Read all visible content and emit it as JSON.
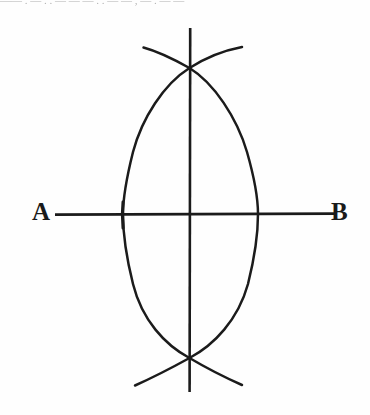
{
  "figure": {
    "background_color": "#fefefe",
    "ink_color": "#1b1b1b",
    "labels": {
      "left_endpoint": "A",
      "right_endpoint": "B"
    },
    "scan_artifact_text": "—— . — . . — — — . . — — , — . — —",
    "geometry": {
      "canvas": {
        "width": 370,
        "height": 415
      },
      "baseline": {
        "name": "segment-ab",
        "y": 214,
        "x_start": 55,
        "x_end": 335,
        "stroke_width": 2.6
      },
      "perpendicular": {
        "name": "vertical-bisector",
        "x": 190,
        "y_start": 28,
        "y_end": 392,
        "stroke_width": 2.6
      },
      "point_a": {
        "x": 123,
        "y": 214
      },
      "point_b": {
        "x": 264,
        "y": 214
      },
      "intersection_top": {
        "x": 190,
        "y": 68
      },
      "intersection_bottom": {
        "x": 190,
        "y": 358
      },
      "arc_radius": 156,
      "arc_left": {
        "name": "arc-centered-at-b",
        "center_x": 264,
        "center_y": 214,
        "path": "M 143 47 C 128 68 119 110 119 152 C 119 196 120 236 124 268 C 129 312 140 356 152 382",
        "stroke_width": 2.4
      },
      "arc_right": {
        "name": "arc-centered-at-a",
        "center_x": 123,
        "center_y": 214,
        "path": "M 242 47 C 254 70 264 112 266 154 C 268 198 266 240 261 272 C 254 316 242 358 232 382",
        "stroke_width": 2.4
      },
      "arc_tails": [
        {
          "name": "tail-top-left",
          "end_x": 143,
          "end_y": 47
        },
        {
          "name": "tail-top-right",
          "end_x": 242,
          "end_y": 47
        },
        {
          "name": "tail-bottom-left",
          "end_x": 135,
          "end_y": 385
        },
        {
          "name": "tail-bottom-right",
          "end_x": 242,
          "end_y": 385
        }
      ]
    }
  }
}
